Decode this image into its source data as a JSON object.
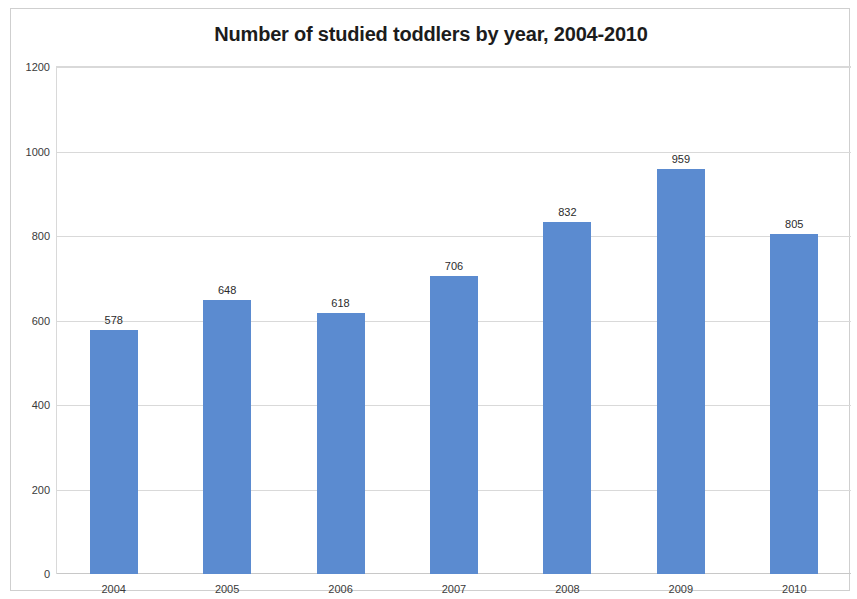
{
  "chart_data": {
    "type": "bar",
    "title": "Number of studied toddlers by year, 2004-2010",
    "xlabel": "",
    "ylabel": "",
    "categories": [
      "2004",
      "2005",
      "2006",
      "2007",
      "2008",
      "2009",
      "2010"
    ],
    "values": [
      578,
      648,
      618,
      706,
      832,
      959,
      805
    ],
    "data_labels": [
      "578",
      "648",
      "618",
      "706",
      "832",
      "959",
      "805"
    ],
    "ylim": [
      0,
      1200
    ],
    "ytick_labels": [
      "0",
      "200",
      "400",
      "600",
      "800",
      "1000",
      "1200"
    ],
    "ytick_values": [
      0,
      200,
      400,
      600,
      800,
      1000,
      1200
    ],
    "grid": true,
    "grid_axis": "y",
    "legend": false,
    "legend_position": "none",
    "series": [
      {
        "name": "Number of studied toddlers",
        "values": [
          578,
          648,
          618,
          706,
          832,
          959,
          805
        ],
        "color": "#5b8bd0"
      }
    ],
    "colors": {
      "bar": "#5b8bd0",
      "gridline": "#d9d9d9",
      "frame_border": "#cfcfcf",
      "title_text": "#1c1c1c",
      "tick_text": "#3a3a3a",
      "label_text": "#2b2b2b",
      "background": "#ffffff"
    }
  }
}
